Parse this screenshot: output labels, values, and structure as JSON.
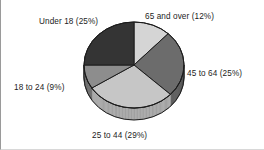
{
  "chart_data": {
    "type": "pie",
    "title": "",
    "subtitle": "",
    "xlabel": "",
    "ylabel": "",
    "legend_position": "none",
    "grid": false,
    "labels_show_percent": true,
    "start_angle_deg": 0,
    "direction": "clockwise",
    "three_d": true,
    "categories": [
      "65 and over",
      "45 to 64",
      "25 to 44",
      "18 to 24",
      "Under 18"
    ],
    "values": [
      12,
      25,
      29,
      9,
      25
    ],
    "slices": [
      {
        "name": "65 and over",
        "percent": 12,
        "label": "65 and over (12%)",
        "color": "#d5d5d5",
        "side_color": "#b4b4b4"
      },
      {
        "name": "45 to 64",
        "percent": 25,
        "label": "45 to 64 (25%)",
        "color": "#6c6c6c",
        "side_color": "#565656"
      },
      {
        "name": "25 to 44",
        "percent": 29,
        "label": "25 to 44 (29%)",
        "color": "#c6c6c6",
        "side_color": "#a3a3a3"
      },
      {
        "name": "18 to 24",
        "percent": 9,
        "label": "18 to 24 (9%)",
        "color": "#8d8d8d",
        "side_color": "#747474"
      },
      {
        "name": "Under 18",
        "percent": 25,
        "label": "Under 18 (25%)",
        "color": "#343434",
        "side_color": "#2a2a2a"
      }
    ],
    "colors": {
      "outline": "#1c1c1c",
      "background": "#ffffff",
      "label_text": "#1c1c1c",
      "frame_left": "#9a9a9a",
      "frame_bottom": "#d8d8d8"
    },
    "geometry": {
      "center_x": 133,
      "center_y": 65,
      "radius_x": 50,
      "radius_y": 43,
      "depth": 12
    }
  }
}
